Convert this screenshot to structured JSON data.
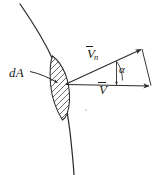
{
  "figure": {
    "stroke_color": "#2b2b2b",
    "hatch_color": "#3a3a3a",
    "background": "#ffffff",
    "labels": {
      "area_element": "dA",
      "normal_velocity_symbol": "V",
      "normal_velocity_subscript": "n",
      "velocity_symbol": "V",
      "angle": "α"
    },
    "geometry": {
      "origin": {
        "x": 66,
        "y": 84
      },
      "v_tip": {
        "x": 150,
        "y": 86
      },
      "vn_tip": {
        "x": 142,
        "y": 49
      },
      "parallelogram_corner": {
        "x": 151,
        "y": 85
      },
      "angle_marker_x": 116,
      "leader_start": {
        "x": 30,
        "y": 72
      },
      "leader_end": {
        "x": 57,
        "y": 82
      },
      "curve_top": {
        "x": 20,
        "y": 4
      },
      "curve_bottom": {
        "x": 74,
        "y": 175
      },
      "lens_center": {
        "x": 60,
        "y": 85
      }
    }
  }
}
